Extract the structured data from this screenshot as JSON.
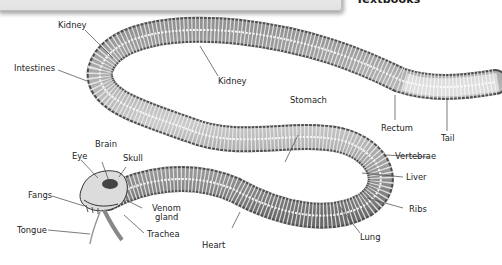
{
  "header": {
    "partial_title": "Textbooks"
  },
  "diagram": {
    "labels": [
      {
        "id": "kidney_top",
        "text": "Kidney"
      },
      {
        "id": "intestines",
        "text": "Intestines"
      },
      {
        "id": "kidney_mid",
        "text": "Kidney"
      },
      {
        "id": "stomach",
        "text": "Stomach"
      },
      {
        "id": "rectum",
        "text": "Rectum"
      },
      {
        "id": "tail",
        "text": "Tail"
      },
      {
        "id": "vertebrae",
        "text": "Vertebrae"
      },
      {
        "id": "liver",
        "text": "Liver"
      },
      {
        "id": "ribs",
        "text": "Ribs"
      },
      {
        "id": "lung",
        "text": "Lung"
      },
      {
        "id": "heart",
        "text": "Heart"
      },
      {
        "id": "brain",
        "text": "Brain"
      },
      {
        "id": "eye",
        "text": "Eye"
      },
      {
        "id": "skull",
        "text": "Skull"
      },
      {
        "id": "fangs",
        "text": "Fangs"
      },
      {
        "id": "venom_gland_1",
        "text": "Venom"
      },
      {
        "id": "venom_gland_2",
        "text": "gland"
      },
      {
        "id": "tongue",
        "text": "Tongue"
      },
      {
        "id": "trachea",
        "text": "Trachea"
      }
    ],
    "colors": {
      "bone": "#d9d9d9",
      "body_dark": "#555555",
      "leader_line": "#444444",
      "text": "#222222"
    }
  }
}
